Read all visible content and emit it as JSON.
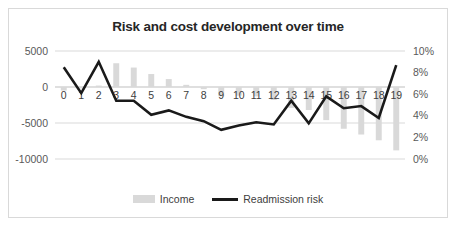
{
  "chart": {
    "title": "Risk and cost development over time",
    "border_color": "#d9d9d9",
    "background": "#ffffff"
  },
  "legend": {
    "position": "bottom",
    "entries": [
      {
        "label": "Income",
        "marker": "bar-swatch",
        "color": "#d9d9d9"
      },
      {
        "label": "Readmission risk",
        "marker": "line-swatch",
        "color": "#1a1a1a"
      }
    ]
  },
  "axes": {
    "left_ticks": [
      "5000",
      "0",
      "-5000",
      "-10000"
    ],
    "right_ticks": [
      "10%",
      "8%",
      "6%",
      "4%",
      "2%",
      "0%"
    ],
    "category_ticks": [
      "0",
      "1",
      "2",
      "3",
      "4",
      "5",
      "6",
      "7",
      "8",
      "9",
      "10",
      "11",
      "12",
      "13",
      "14",
      "15",
      "16",
      "17",
      "18",
      "19"
    ]
  },
  "chart_data": {
    "type": "bar",
    "title": "Risk and cost development over time",
    "xlabel": "",
    "ylabel": "",
    "grid": true,
    "legend_position": "bottom",
    "categories": [
      "0",
      "1",
      "2",
      "3",
      "4",
      "5",
      "6",
      "7",
      "8",
      "9",
      "10",
      "11",
      "12",
      "13",
      "14",
      "15",
      "16",
      "17",
      "18",
      "19"
    ],
    "series": [
      {
        "name": "Income",
        "type": "bar",
        "axis": "left",
        "color": "#d9d9d9",
        "ylim": [
          -10000,
          5000
        ],
        "yticks": [
          5000,
          0,
          -5000,
          -10000
        ],
        "ytick_labels": [
          "5000",
          "0",
          "-5000",
          "-10000"
        ],
        "values": [
          -500,
          -200,
          200,
          3300,
          2700,
          1800,
          1100,
          300,
          -300,
          -1300,
          -1200,
          -1300,
          -1800,
          -2900,
          -3200,
          -4600,
          -5800,
          -6600,
          -7400,
          -8800
        ]
      },
      {
        "name": "Readmission risk",
        "type": "line",
        "axis": "right",
        "color": "#1a1a1a",
        "ylim": [
          0,
          10
        ],
        "yticks": [
          10,
          8,
          6,
          4,
          2,
          0
        ],
        "ytick_labels": [
          "10%",
          "8%",
          "6%",
          "4%",
          "2%",
          "0%"
        ],
        "unit": "%",
        "values": [
          8.5,
          6.1,
          9.0,
          5.4,
          5.4,
          4.1,
          4.5,
          3.9,
          3.5,
          2.7,
          3.1,
          3.4,
          3.2,
          5.4,
          3.3,
          5.8,
          4.7,
          4.9,
          3.8,
          8.7
        ]
      }
    ]
  }
}
